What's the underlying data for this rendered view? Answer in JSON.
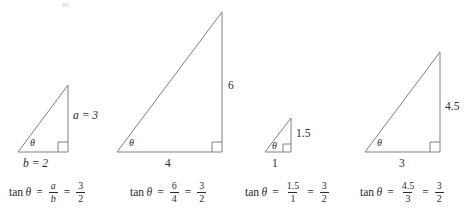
{
  "figure": {
    "stroke_color": "#808080",
    "text_color": "#2b2b2b",
    "angle_symbol": "θ"
  },
  "triangles": [
    {
      "id": "triangle-1",
      "opposite_label": "a = 3",
      "adjacent_label": "b = 2",
      "angle_label": "θ",
      "opposite_value": 3,
      "adjacent_value": 2,
      "formula": {
        "function": "tan",
        "angle": "θ",
        "equals": "=",
        "ratio_numerator": "a",
        "ratio_denominator": "b",
        "equals2": "=",
        "result_numerator": "3",
        "result_denominator": "2"
      }
    },
    {
      "id": "triangle-2",
      "opposite_label": "6",
      "adjacent_label": "4",
      "angle_label": "θ",
      "opposite_value": 6,
      "adjacent_value": 4,
      "formula": {
        "function": "tan",
        "angle": "θ",
        "equals": "=",
        "ratio_numerator": "6",
        "ratio_denominator": "4",
        "equals2": "=",
        "result_numerator": "3",
        "result_denominator": "2"
      }
    },
    {
      "id": "triangle-3",
      "opposite_label": "1.5",
      "adjacent_label": "1",
      "angle_label": "θ",
      "opposite_value": 1.5,
      "adjacent_value": 1,
      "formula": {
        "function": "tan",
        "angle": "θ",
        "equals": "=",
        "ratio_numerator": "1.5",
        "ratio_denominator": "1",
        "equals2": "=",
        "result_numerator": "3",
        "result_denominator": "2"
      }
    },
    {
      "id": "triangle-4",
      "opposite_label": "4.5",
      "adjacent_label": "3",
      "angle_label": "θ",
      "opposite_value": 4.5,
      "adjacent_value": 3,
      "formula": {
        "function": "tan",
        "angle": "θ",
        "equals": "=",
        "ratio_numerator": "4.5",
        "ratio_denominator": "3",
        "equals2": "=",
        "result_numerator": "3",
        "result_denominator": "2"
      }
    }
  ]
}
